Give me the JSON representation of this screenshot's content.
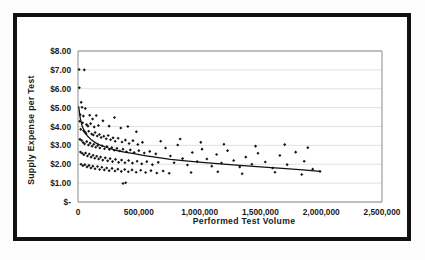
{
  "chart_data": {
    "type": "scatter",
    "title": "",
    "xlabel": "Performed Test Volume",
    "ylabel": "Supply Expense per Test",
    "xlim": [
      0,
      2500000
    ],
    "ylim": [
      0,
      8
    ],
    "grid": true,
    "legend": false,
    "legend_position": "none",
    "xticks": [
      0,
      500000,
      1000000,
      1500000,
      2000000,
      2500000
    ],
    "xticklabels": [
      "0",
      "500,000",
      "1,000,000",
      "1,500,000",
      "2,000,000",
      "2,500,000"
    ],
    "yticks": [
      0,
      1,
      2,
      3,
      4,
      5,
      6,
      7,
      8
    ],
    "yticklabels": [
      "$-",
      "$1.00",
      "$2.00",
      "$3.00",
      "$4.00",
      "$5.00",
      "$6.00",
      "$7.00",
      "$8.00"
    ],
    "series": [
      {
        "name": "Hospitals",
        "marker": "diamond",
        "color": "#151515",
        "points": [
          [
            9000,
            7.02
          ],
          [
            52000,
            7.0
          ],
          [
            11000,
            6.05
          ],
          [
            26000,
            5.28
          ],
          [
            33000,
            5.02
          ],
          [
            60000,
            4.95
          ],
          [
            18000,
            4.62
          ],
          [
            44000,
            4.55
          ],
          [
            96000,
            4.6
          ],
          [
            120000,
            4.4
          ],
          [
            150000,
            4.58
          ],
          [
            205000,
            4.3
          ],
          [
            14000,
            4.28
          ],
          [
            38000,
            4.2
          ],
          [
            70000,
            4.1
          ],
          [
            82000,
            4.02
          ],
          [
            104000,
            4.15
          ],
          [
            133000,
            3.98
          ],
          [
            168000,
            4.05
          ],
          [
            256000,
            4.02
          ],
          [
            300000,
            4.48
          ],
          [
            352000,
            3.92
          ],
          [
            410000,
            4.0
          ],
          [
            480000,
            3.72
          ],
          [
            22000,
            3.85
          ],
          [
            46000,
            3.78
          ],
          [
            58000,
            3.7
          ],
          [
            66000,
            3.62
          ],
          [
            88000,
            3.75
          ],
          [
            112000,
            3.6
          ],
          [
            126000,
            3.55
          ],
          [
            141000,
            3.68
          ],
          [
            158000,
            3.5
          ],
          [
            176000,
            3.58
          ],
          [
            190000,
            3.42
          ],
          [
            212000,
            3.48
          ],
          [
            232000,
            3.35
          ],
          [
            248000,
            3.52
          ],
          [
            268000,
            3.3
          ],
          [
            288000,
            3.4
          ],
          [
            306000,
            3.22
          ],
          [
            330000,
            3.38
          ],
          [
            362000,
            3.18
          ],
          [
            390000,
            3.28
          ],
          [
            420000,
            3.1
          ],
          [
            452000,
            3.25
          ],
          [
            492000,
            3.05
          ],
          [
            530000,
            3.16
          ],
          [
            16000,
            3.32
          ],
          [
            30000,
            3.26
          ],
          [
            42000,
            3.15
          ],
          [
            54000,
            3.08
          ],
          [
            72000,
            3.2
          ],
          [
            86000,
            3.02
          ],
          [
            100000,
            3.12
          ],
          [
            116000,
            2.96
          ],
          [
            130000,
            3.06
          ],
          [
            146000,
            2.9
          ],
          [
            162000,
            3.0
          ],
          [
            180000,
            2.86
          ],
          [
            198000,
            2.98
          ],
          [
            218000,
            2.82
          ],
          [
            238000,
            2.94
          ],
          [
            258000,
            2.78
          ],
          [
            278000,
            2.88
          ],
          [
            298000,
            2.74
          ],
          [
            320000,
            2.84
          ],
          [
            344000,
            2.7
          ],
          [
            370000,
            2.8
          ],
          [
            398000,
            2.66
          ],
          [
            430000,
            2.76
          ],
          [
            462000,
            2.62
          ],
          [
            500000,
            2.72
          ],
          [
            545000,
            2.6
          ],
          [
            590000,
            2.68
          ],
          [
            640000,
            2.55
          ],
          [
            20000,
            2.65
          ],
          [
            34000,
            2.58
          ],
          [
            48000,
            2.5
          ],
          [
            62000,
            2.6
          ],
          [
            78000,
            2.44
          ],
          [
            92000,
            2.54
          ],
          [
            108000,
            2.38
          ],
          [
            124000,
            2.48
          ],
          [
            138000,
            2.32
          ],
          [
            154000,
            2.42
          ],
          [
            170000,
            2.28
          ],
          [
            186000,
            2.38
          ],
          [
            204000,
            2.22
          ],
          [
            224000,
            2.34
          ],
          [
            244000,
            2.18
          ],
          [
            264000,
            2.3
          ],
          [
            284000,
            2.14
          ],
          [
            308000,
            2.26
          ],
          [
            334000,
            2.1
          ],
          [
            358000,
            2.22
          ],
          [
            386000,
            2.08
          ],
          [
            416000,
            2.2
          ],
          [
            448000,
            2.06
          ],
          [
            486000,
            2.16
          ],
          [
            524000,
            2.02
          ],
          [
            566000,
            2.14
          ],
          [
            612000,
            1.98
          ],
          [
            660000,
            2.1
          ],
          [
            25000,
            2.0
          ],
          [
            40000,
            1.92
          ],
          [
            56000,
            1.98
          ],
          [
            74000,
            1.86
          ],
          [
            90000,
            1.94
          ],
          [
            106000,
            1.8
          ],
          [
            122000,
            1.9
          ],
          [
            140000,
            1.76
          ],
          [
            160000,
            1.88
          ],
          [
            178000,
            1.72
          ],
          [
            196000,
            1.84
          ],
          [
            216000,
            1.7
          ],
          [
            236000,
            1.8
          ],
          [
            256000,
            1.66
          ],
          [
            280000,
            1.78
          ],
          [
            304000,
            1.64
          ],
          [
            328000,
            1.74
          ],
          [
            356000,
            1.62
          ],
          [
            384000,
            1.72
          ],
          [
            414000,
            1.6
          ],
          [
            444000,
            1.7
          ],
          [
            478000,
            1.58
          ],
          [
            516000,
            1.68
          ],
          [
            556000,
            1.56
          ],
          [
            600000,
            1.66
          ],
          [
            648000,
            1.54
          ],
          [
            700000,
            1.64
          ],
          [
            392000,
            1.02
          ],
          [
            370000,
            0.98
          ],
          [
            720000,
            2.86
          ],
          [
            760000,
            2.44
          ],
          [
            790000,
            2.08
          ],
          [
            820000,
            3.02
          ],
          [
            860000,
            2.3
          ],
          [
            900000,
            1.96
          ],
          [
            940000,
            2.62
          ],
          [
            980000,
            2.14
          ],
          [
            1020000,
            2.8
          ],
          [
            1060000,
            2.28
          ],
          [
            1100000,
            1.9
          ],
          [
            1140000,
            2.52
          ],
          [
            1180000,
            2.06
          ],
          [
            1230000,
            2.72
          ],
          [
            1280000,
            2.2
          ],
          [
            1330000,
            1.86
          ],
          [
            1380000,
            2.38
          ],
          [
            1430000,
            2.0
          ],
          [
            1480000,
            2.58
          ],
          [
            1540000,
            2.12
          ],
          [
            1600000,
            1.8
          ],
          [
            1660000,
            2.46
          ],
          [
            1720000,
            1.98
          ],
          [
            1790000,
            2.64
          ],
          [
            1860000,
            2.16
          ],
          [
            1930000,
            1.74
          ],
          [
            1990000,
            1.62
          ],
          [
            680000,
            3.22
          ],
          [
            840000,
            3.34
          ],
          [
            1010000,
            3.16
          ],
          [
            1200000,
            3.06
          ],
          [
            1460000,
            2.96
          ],
          [
            1700000,
            3.04
          ],
          [
            1890000,
            2.88
          ],
          [
            750000,
            1.52
          ],
          [
            930000,
            1.56
          ],
          [
            1150000,
            1.6
          ],
          [
            1350000,
            1.5
          ],
          [
            1620000,
            1.58
          ],
          [
            1840000,
            1.46
          ]
        ]
      }
    ],
    "trendline": {
      "name": "Power trend",
      "color": "#111111",
      "points": [
        [
          6000,
          5.05
        ],
        [
          18000,
          4.45
        ],
        [
          34000,
          4.02
        ],
        [
          54000,
          3.72
        ],
        [
          80000,
          3.48
        ],
        [
          112000,
          3.28
        ],
        [
          150000,
          3.12
        ],
        [
          196000,
          2.98
        ],
        [
          250000,
          2.86
        ],
        [
          312000,
          2.74
        ],
        [
          382000,
          2.64
        ],
        [
          460000,
          2.56
        ],
        [
          548000,
          2.46
        ],
        [
          648000,
          2.36
        ],
        [
          760000,
          2.26
        ],
        [
          884000,
          2.18
        ],
        [
          1020000,
          2.1
        ],
        [
          1170000,
          2.02
        ],
        [
          1330000,
          1.94
        ],
        [
          1500000,
          1.86
        ],
        [
          1680000,
          1.78
        ],
        [
          1850000,
          1.7
        ],
        [
          1990000,
          1.62
        ]
      ]
    }
  }
}
